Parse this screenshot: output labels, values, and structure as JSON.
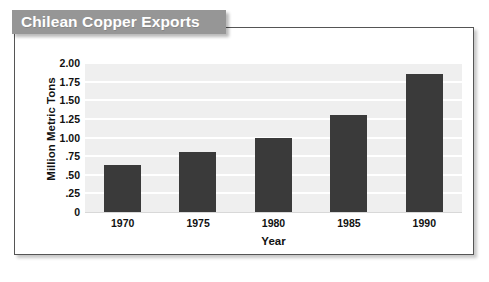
{
  "title": {
    "text": "Chilean Copper Exports",
    "banner_color": "#969696",
    "text_color": "#ffffff"
  },
  "chart_data": {
    "type": "bar",
    "title": "Chilean Copper Exports",
    "xlabel": "Year",
    "ylabel": "Million Metric Tons",
    "categories": [
      "1970",
      "1975",
      "1980",
      "1985",
      "1990"
    ],
    "values": [
      0.63,
      0.8,
      1.0,
      1.3,
      1.85
    ],
    "ylim": [
      0,
      2.0
    ],
    "ytick_values": [
      2.0,
      1.75,
      1.5,
      1.25,
      1.0,
      0.75,
      0.5,
      0.25,
      0
    ],
    "ytick_labels": [
      "2.00",
      "1.75",
      "1.50",
      "1.25",
      "1.00",
      ".75",
      ".50",
      ".25",
      "0"
    ],
    "grid": true,
    "legend": false,
    "bar_color": "#3a3a3a",
    "plot_background": "#efefef",
    "gridline_color": "#ffffff"
  }
}
